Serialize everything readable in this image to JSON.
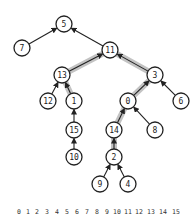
{
  "diagram": {
    "title": "",
    "node_radius": 8,
    "colors": {
      "node_stroke": "#222222",
      "edge": "#222222",
      "highlight": "#b8b8b8",
      "background": "#ffffff"
    },
    "nodes": [
      {
        "id": "5",
        "label": "5",
        "x": 64,
        "y": 24
      },
      {
        "id": "7",
        "label": "7",
        "x": 22,
        "y": 48
      },
      {
        "id": "11",
        "label": "11",
        "x": 110,
        "y": 50
      },
      {
        "id": "13",
        "label": "13",
        "x": 62,
        "y": 75
      },
      {
        "id": "3",
        "label": "3",
        "x": 155,
        "y": 75
      },
      {
        "id": "12",
        "label": "12",
        "x": 48,
        "y": 101
      },
      {
        "id": "1",
        "label": "1",
        "x": 74,
        "y": 101
      },
      {
        "id": "0",
        "label": "0",
        "x": 128,
        "y": 101
      },
      {
        "id": "6",
        "label": "6",
        "x": 181,
        "y": 101
      },
      {
        "id": "15",
        "label": "15",
        "x": 74,
        "y": 130
      },
      {
        "id": "14",
        "label": "14",
        "x": 114,
        "y": 130
      },
      {
        "id": "8",
        "label": "8",
        "x": 155,
        "y": 130
      },
      {
        "id": "10",
        "label": "10",
        "x": 74,
        "y": 157
      },
      {
        "id": "2",
        "label": "2",
        "x": 114,
        "y": 157
      },
      {
        "id": "9",
        "label": "9",
        "x": 100,
        "y": 184
      },
      {
        "id": "4",
        "label": "4",
        "x": 128,
        "y": 184
      }
    ],
    "edges": [
      {
        "from": "7",
        "to": "5",
        "highlighted": false
      },
      {
        "from": "11",
        "to": "5",
        "highlighted": false
      },
      {
        "from": "13",
        "to": "11",
        "highlighted": true
      },
      {
        "from": "3",
        "to": "11",
        "highlighted": true
      },
      {
        "from": "12",
        "to": "13",
        "highlighted": false
      },
      {
        "from": "1",
        "to": "13",
        "highlighted": true
      },
      {
        "from": "0",
        "to": "3",
        "highlighted": true
      },
      {
        "from": "6",
        "to": "3",
        "highlighted": false
      },
      {
        "from": "15",
        "to": "1",
        "highlighted": false
      },
      {
        "from": "14",
        "to": "0",
        "highlighted": true
      },
      {
        "from": "8",
        "to": "0",
        "highlighted": false
      },
      {
        "from": "10",
        "to": "15",
        "highlighted": false
      },
      {
        "from": "2",
        "to": "14",
        "highlighted": true
      },
      {
        "from": "9",
        "to": "2",
        "highlighted": false
      },
      {
        "from": "4",
        "to": "2",
        "highlighted": false
      }
    ],
    "index_row": {
      "y": 214,
      "labels": [
        "0",
        "1",
        "2",
        "3",
        "4",
        "5",
        "6",
        "7",
        "8",
        "9",
        "10",
        "11",
        "12",
        "13",
        "14",
        "15"
      ],
      "x_positions": [
        17,
        26,
        35,
        45,
        55,
        65,
        75,
        85,
        95,
        105,
        113,
        124,
        135,
        147,
        159,
        172
      ]
    }
  }
}
